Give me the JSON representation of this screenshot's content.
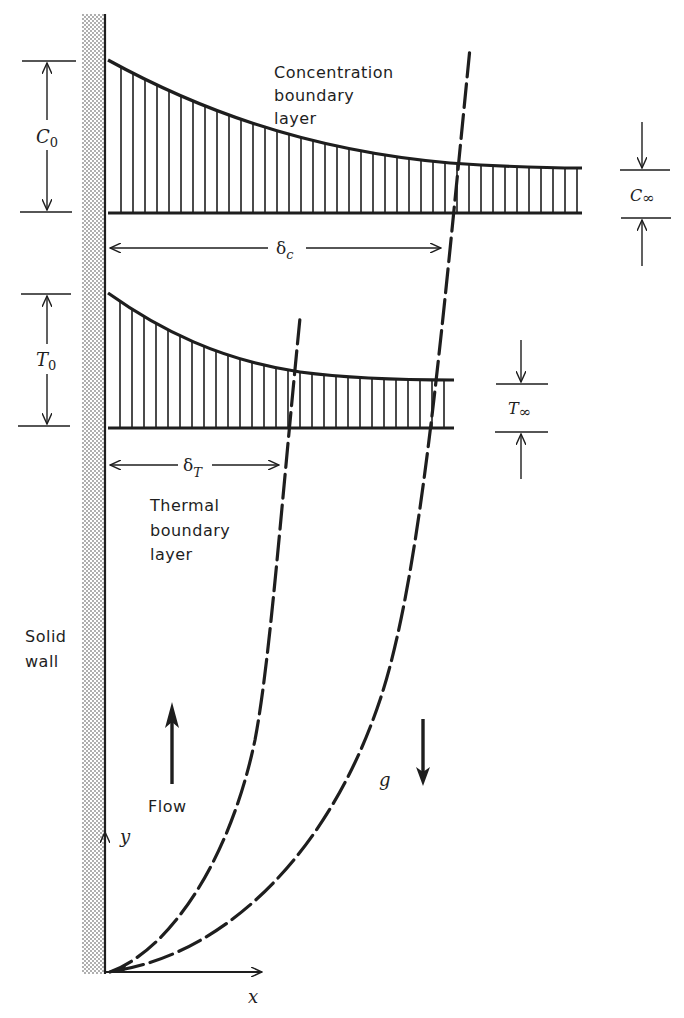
{
  "figure": {
    "colors": {
      "ink": "#1e1e1e",
      "background": "#ffffff",
      "wall_stipple": "#9a9a9a"
    }
  },
  "labels": {
    "concentration_boundary_layer": [
      "Concentration",
      "boundary",
      "layer"
    ],
    "thermal_boundary_layer": [
      "Thermal",
      "boundary",
      "layer"
    ],
    "solid_wall": [
      "Solid",
      "wall"
    ],
    "flow": "Flow",
    "gravity": "g",
    "x_axis": "x",
    "y_axis": "y"
  },
  "symbols": {
    "c0": {
      "main": "C",
      "sub": "0"
    },
    "c_inf": {
      "main": "C",
      "sub": "∞"
    },
    "t0": {
      "main": "T",
      "sub": "0"
    },
    "t_inf": {
      "main": "T",
      "sub": "∞"
    },
    "delta_c": {
      "main": "δ",
      "sub": "c"
    },
    "delta_t": {
      "main": "δ",
      "sub": "T"
    }
  }
}
